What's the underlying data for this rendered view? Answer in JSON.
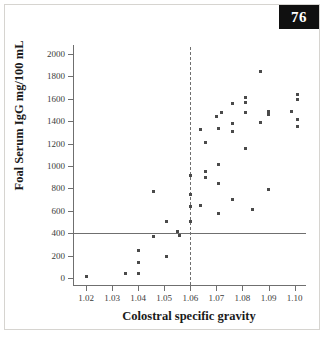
{
  "page": {
    "badge_number": "76"
  },
  "chart_data": {
    "type": "scatter",
    "title": "",
    "xlabel": "Colostral specific gravity",
    "ylabel": "Foal Serum IgG mg/100 mL",
    "xlim": [
      1.015,
      1.104
    ],
    "ylim": [
      -60,
      2060
    ],
    "xticks": [
      "1.02",
      "1.03",
      "1.04",
      "1.05",
      "1.06",
      "1.07",
      "1.08",
      "1.09",
      "1.10"
    ],
    "xtick_values": [
      1.02,
      1.03,
      1.04,
      1.05,
      1.06,
      1.07,
      1.08,
      1.09,
      1.1
    ],
    "yticks": [
      "0",
      "200",
      "400",
      "600",
      "800",
      "1000",
      "1200",
      "1400",
      "1600",
      "1800",
      "2000"
    ],
    "ytick_values": [
      0,
      200,
      400,
      600,
      800,
      1000,
      1200,
      1400,
      1600,
      1800,
      2000
    ],
    "grid": false,
    "legend": null,
    "marker_color": "#4a4a4a",
    "axis_color": "#6f6f6f",
    "reference_lines": [
      {
        "orientation": "horizontal",
        "value": 400,
        "style": "solid",
        "color": "#6f6f6f",
        "x_start": 1.015,
        "x_end": 1.1045
      },
      {
        "orientation": "vertical",
        "value": 1.06,
        "style": "dashed",
        "color": "#6f6f6f",
        "y_start": -60,
        "y_end": 2060
      }
    ],
    "points": [
      [
        1.02,
        15
      ],
      [
        1.035,
        40
      ],
      [
        1.04,
        40
      ],
      [
        1.04,
        140
      ],
      [
        1.04,
        245
      ],
      [
        1.046,
        770
      ],
      [
        1.051,
        190
      ],
      [
        1.051,
        510
      ],
      [
        1.046,
        370
      ],
      [
        1.055,
        415
      ],
      [
        1.056,
        385
      ],
      [
        1.06,
        510
      ],
      [
        1.06,
        635
      ],
      [
        1.06,
        745
      ],
      [
        1.06,
        915
      ],
      [
        1.064,
        645
      ],
      [
        1.064,
        1325
      ],
      [
        1.066,
        900
      ],
      [
        1.066,
        950
      ],
      [
        1.066,
        1210
      ],
      [
        1.071,
        575
      ],
      [
        1.071,
        845
      ],
      [
        1.071,
        1010
      ],
      [
        1.071,
        1330
      ],
      [
        1.07,
        1440
      ],
      [
        1.072,
        1480
      ],
      [
        1.076,
        705
      ],
      [
        1.076,
        1305
      ],
      [
        1.076,
        1380
      ],
      [
        1.076,
        1555
      ],
      [
        1.081,
        1155
      ],
      [
        1.081,
        1475
      ],
      [
        1.081,
        1570
      ],
      [
        1.081,
        1610
      ],
      [
        1.084,
        610
      ],
      [
        1.087,
        1840
      ],
      [
        1.087,
        1390
      ],
      [
        1.09,
        790
      ],
      [
        1.09,
        1460
      ],
      [
        1.09,
        1485
      ],
      [
        1.099,
        1485
      ],
      [
        1.101,
        1355
      ],
      [
        1.101,
        1410
      ],
      [
        1.101,
        1590
      ],
      [
        1.101,
        1640
      ]
    ]
  }
}
